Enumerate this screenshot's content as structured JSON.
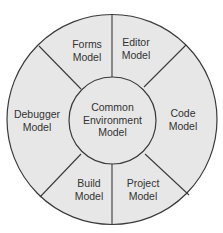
{
  "diagram": {
    "type": "segmented-ring",
    "colors": {
      "fill": "#e7e7e7",
      "stroke": "#3a3a3a",
      "text": "#333333",
      "background": "#ffffff"
    },
    "hub": {
      "label_lines": [
        "Common",
        "Environment",
        "Model"
      ]
    },
    "segments": [
      {
        "id": "forms",
        "label_lines": [
          "Forms",
          "Model"
        ]
      },
      {
        "id": "editor",
        "label_lines": [
          "Editor",
          "Model"
        ]
      },
      {
        "id": "code",
        "label_lines": [
          "Code",
          "Model"
        ]
      },
      {
        "id": "project",
        "label_lines": [
          "Project",
          "Model"
        ]
      },
      {
        "id": "build",
        "label_lines": [
          "Build",
          "Model"
        ]
      },
      {
        "id": "debugger",
        "label_lines": [
          "Debugger",
          "Model"
        ]
      }
    ]
  }
}
